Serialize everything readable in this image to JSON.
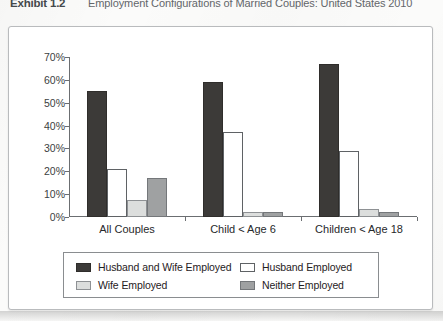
{
  "header": {
    "exhibit_label": "Exhibit 1.2",
    "title": "Employment Configurations of Married Couples: United States 2010"
  },
  "chart_data": {
    "type": "bar",
    "title": "Employment Configurations of Married Couples: United States 2010",
    "xlabel": "",
    "ylabel": "",
    "ylim": [
      0,
      70
    ],
    "ytick_labels": [
      "0%",
      "10%",
      "20%",
      "30%",
      "40%",
      "50%",
      "60%",
      "70%"
    ],
    "ytick_values": [
      0,
      10,
      20,
      30,
      40,
      50,
      60,
      70
    ],
    "grid": false,
    "legend_position": "bottom",
    "categories": [
      "All Couples",
      "Child < Age 6",
      "Children < Age 18"
    ],
    "series": [
      {
        "name": "Husband and Wife Employed",
        "key": "series-hw",
        "color": "#3c3a38",
        "values": [
          55,
          59,
          67
        ]
      },
      {
        "name": "Husband Employed",
        "key": "series-h",
        "color": "#ffffff",
        "values": [
          21,
          37,
          29
        ]
      },
      {
        "name": "Wife Employed",
        "key": "series-w",
        "color": "#dcdedd",
        "values": [
          7.5,
          2,
          3.5
        ]
      },
      {
        "name": "Neither Employed",
        "key": "series-n",
        "color": "#9fa1a2",
        "values": [
          17,
          2,
          2
        ]
      }
    ]
  },
  "legend": {
    "entries": [
      {
        "label": "Husband and Wife Employed",
        "key": "series-hw"
      },
      {
        "label": "Husband Employed",
        "key": "series-h"
      },
      {
        "label": "Wife Employed",
        "key": "series-w"
      },
      {
        "label": "Neither Employed",
        "key": "series-n"
      }
    ]
  }
}
